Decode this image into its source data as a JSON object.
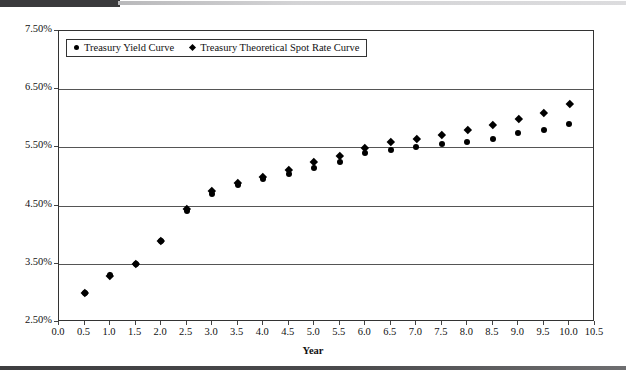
{
  "figure": {
    "axis_title_x": "Year",
    "top_rule_color": "#3a3a3c",
    "bottom_rule_color": "#3e3e40",
    "marker_color": "#000000",
    "gridline_color": "#555555",
    "frame_color": "#333333"
  },
  "legend": {
    "entries": [
      {
        "label": "Treasury Yield Curve",
        "marker": "circle-marker"
      },
      {
        "label": "Treasury Theoretical Spot Rate Curve",
        "marker": "diamond-marker"
      }
    ]
  },
  "chart_data": {
    "type": "scatter",
    "title": "",
    "subtitle": "",
    "xlabel": "Year",
    "ylabel": "",
    "xlim": [
      0.0,
      10.5
    ],
    "ylim": [
      2.5,
      7.5
    ],
    "grid": true,
    "legend_position": "top-left-inside",
    "x_ticks": [
      "0.0",
      "0.5",
      "1.0",
      "1.5",
      "2.0",
      "2.5",
      "3.0",
      "3.5",
      "4.0",
      "4.5",
      "5.0",
      "5.5",
      "6.0",
      "6.5",
      "7.0",
      "7.5",
      "8.0",
      "8.5",
      "9.0",
      "9.5",
      "10.0",
      "10.5"
    ],
    "x_tick_values": [
      0.0,
      0.5,
      1.0,
      1.5,
      2.0,
      2.5,
      3.0,
      3.5,
      4.0,
      4.5,
      5.0,
      5.5,
      6.0,
      6.5,
      7.0,
      7.5,
      8.0,
      8.5,
      9.0,
      9.5,
      10.0,
      10.5
    ],
    "y_ticks": [
      "2.50%",
      "3.50%",
      "4.50%",
      "5.50%",
      "6.50%",
      "7.50%"
    ],
    "y_tick_values": [
      2.5,
      3.5,
      4.5,
      5.5,
      6.5,
      7.5
    ],
    "x": [
      0.5,
      1.0,
      1.5,
      2.0,
      2.5,
      3.0,
      3.5,
      4.0,
      4.5,
      5.0,
      5.5,
      6.0,
      6.5,
      7.0,
      7.5,
      8.0,
      8.5,
      9.0,
      9.5,
      10.0
    ],
    "series": [
      {
        "name": "Treasury Yield Curve",
        "marker": "circle",
        "values": [
          3.0,
          3.3,
          3.5,
          3.9,
          4.4,
          4.7,
          4.85,
          4.95,
          5.05,
          5.15,
          5.25,
          5.4,
          5.45,
          5.5,
          5.55,
          5.6,
          5.65,
          5.75,
          5.8,
          5.9
        ]
      },
      {
        "name": "Treasury Theoretical Spot Rate Curve",
        "marker": "diamond",
        "values": [
          3.0,
          3.3,
          3.5,
          3.9,
          4.45,
          4.75,
          4.9,
          5.0,
          5.12,
          5.25,
          5.35,
          5.5,
          5.6,
          5.65,
          5.72,
          5.8,
          5.88,
          6.0,
          6.1,
          6.25
        ]
      }
    ]
  }
}
